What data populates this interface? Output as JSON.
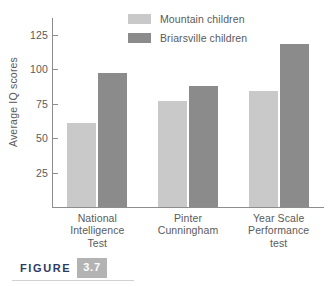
{
  "figure": {
    "word": "FIGURE",
    "number": "3.7",
    "number_box_color": "#b3b3b3",
    "word_color": "#2d3b63"
  },
  "chart_data": {
    "type": "bar",
    "title": "",
    "xlabel": "",
    "ylabel": "Average IQ scores",
    "categories": [
      "National\nIntelligence\nTest",
      "Pinter\nCunningham",
      "Year Scale\nPerformance\ntest"
    ],
    "category_lines": [
      [
        "National",
        "Intelligence",
        "Test"
      ],
      [
        "Pinter",
        "Cunningham"
      ],
      [
        "Year Scale",
        "Performance",
        "test"
      ]
    ],
    "series": [
      {
        "name": "Mountain children",
        "color": "#c9c9c9",
        "values": [
          61,
          77,
          84
        ]
      },
      {
        "name": "Briarsville children",
        "color": "#8b8b8b",
        "values": [
          97,
          88,
          118
        ]
      }
    ],
    "ylim": [
      0,
      137
    ],
    "yticks": [
      25,
      50,
      75,
      100,
      125
    ],
    "ytick_labels": [
      "25",
      "50",
      "75",
      "100",
      "125"
    ],
    "grid": false,
    "legend_position": "top-center"
  }
}
